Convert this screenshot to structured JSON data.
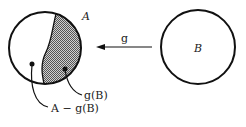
{
  "diagram": {
    "set_a_label": "A",
    "set_b_label": "B",
    "map_label": "g",
    "image_label": "g(B)",
    "difference_label": "A − g(B)",
    "colors": {
      "stroke": "#111111",
      "shade": "#9a9a9a",
      "background": "#ffffff"
    }
  }
}
